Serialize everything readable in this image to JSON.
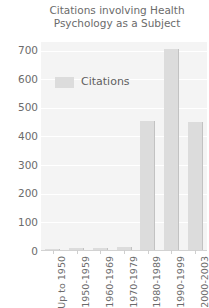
{
  "chart_data": {
    "type": "bar",
    "title": "Citations involving Health\nPsychology as a Subject",
    "title_line1": "Citations involving Health",
    "title_line2": "Psychology as a Subject",
    "xlabel": "",
    "ylabel": "",
    "categories": [
      "Up to 1950",
      "1950-1959",
      "1960-1969",
      "1970-1979",
      "1980-1989",
      "1990-1999",
      "2000-2003"
    ],
    "values": [
      8,
      10,
      12,
      14,
      455,
      707,
      450
    ],
    "series": [
      {
        "name": "Citations",
        "values": [
          8,
          10,
          12,
          14,
          455,
          707,
          450
        ]
      }
    ],
    "ylim": [
      0,
      730
    ],
    "yticks": [
      0,
      100,
      200,
      300,
      400,
      500,
      600,
      700
    ],
    "ytick_labels": [
      "0",
      "100",
      "200",
      "300",
      "400",
      "500",
      "600",
      "700"
    ],
    "grid": true,
    "legend": {
      "entries": [
        "Citations"
      ],
      "position": "inside-upper-left"
    },
    "colors": {
      "bar_fill": "#dcdcdc",
      "bar_edge": "#c2c2c2",
      "plot_background": "#f4f4f4",
      "gridline": "#ffffff",
      "text": "#6b6b6b",
      "page_background": "#ffffff"
    }
  }
}
